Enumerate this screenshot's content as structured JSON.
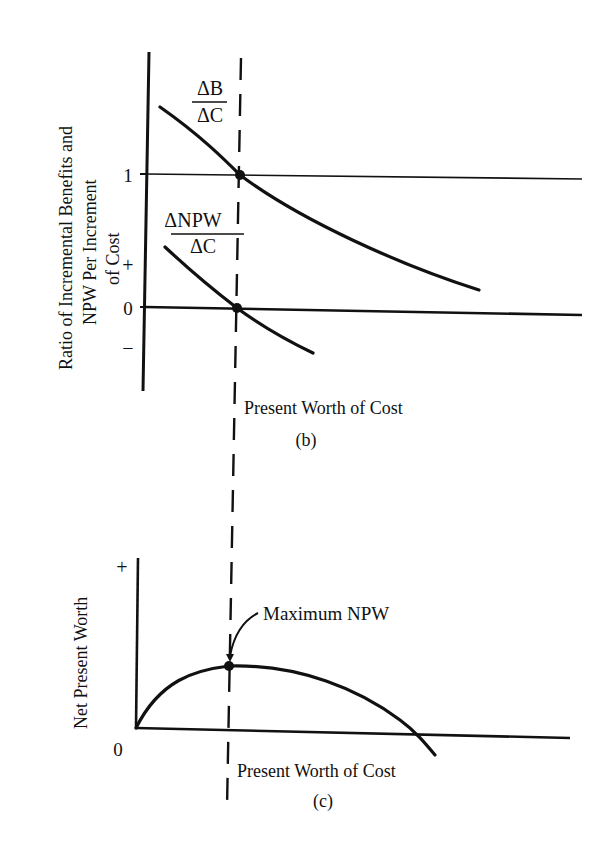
{
  "panel_b": {
    "caption": "(b)",
    "y_axis_label_lines": [
      "Ratio of Incremental Benefits and",
      "NPW Per Increment",
      "of Cost"
    ],
    "x_axis_label": "Present Worth of Cost",
    "ticks": {
      "one": "1",
      "plus": "+",
      "zero": "0",
      "minus": "−"
    },
    "curve_bc": {
      "num": "ΔB",
      "den": "ΔC"
    },
    "curve_npwc": {
      "num": "ΔNPW",
      "den": "ΔC"
    }
  },
  "panel_c": {
    "caption": "(c)",
    "y_axis_label": "Net Present Worth",
    "x_axis_label": "Present Worth of Cost",
    "ticks": {
      "plus": "+",
      "zero": "0"
    },
    "annotation": "Maximum NPW"
  },
  "colors": {
    "ink": "#111111",
    "background": "#ffffff"
  }
}
